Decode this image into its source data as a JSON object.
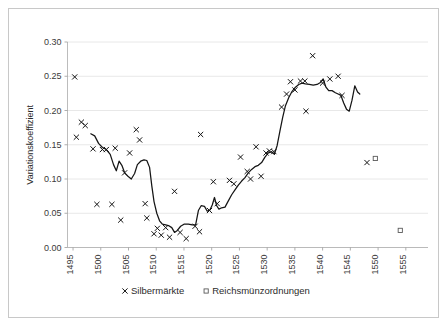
{
  "chart_data": {
    "type": "scatter",
    "title": "",
    "subtitle": "",
    "xlabel": "",
    "ylabel": "Variationskoeffizient",
    "xlim": [
      1494,
      1559
    ],
    "ylim": [
      0.0,
      0.3
    ],
    "grid": true,
    "legend_position": "bottom",
    "y_ticks": [
      "0.00",
      "0.05",
      "0.10",
      "0.15",
      "0.20",
      "0.25",
      "0.30"
    ],
    "y_tick_values": [
      0.0,
      0.05,
      0.1,
      0.15,
      0.2,
      0.25,
      0.3
    ],
    "x_ticks": [
      "1495",
      "1500",
      "1505",
      "1510",
      "1515",
      "1520",
      "1525",
      "1530",
      "1535",
      "1540",
      "1545",
      "1550",
      "1555"
    ],
    "x_tick_values": [
      1495,
      1500,
      1505,
      1510,
      1515,
      1520,
      1525,
      1530,
      1535,
      1540,
      1545,
      1550,
      1555
    ],
    "legend": [
      {
        "label": "Silbermärkte",
        "marker": "x",
        "color": "#141414"
      },
      {
        "label": "Reichsmünzordnungen",
        "marker": "square",
        "color": "#5a5a5a"
      }
    ],
    "series": [
      {
        "name": "Silbermärkte",
        "marker": "x",
        "type": "scatter",
        "points": [
          [
            1495.3,
            0.249
          ],
          [
            1495.6,
            0.161
          ],
          [
            1496.5,
            0.183
          ],
          [
            1497.2,
            0.178
          ],
          [
            1498.6,
            0.144
          ],
          [
            1499.3,
            0.063
          ],
          [
            1500.3,
            0.143
          ],
          [
            1501.0,
            0.143
          ],
          [
            1502.0,
            0.063
          ],
          [
            1502.6,
            0.145
          ],
          [
            1503.6,
            0.04
          ],
          [
            1504.3,
            0.109
          ],
          [
            1505.2,
            0.138
          ],
          [
            1506.4,
            0.172
          ],
          [
            1507.0,
            0.157
          ],
          [
            1508.0,
            0.064
          ],
          [
            1508.3,
            0.043
          ],
          [
            1509.6,
            0.02
          ],
          [
            1510.2,
            0.028
          ],
          [
            1510.9,
            0.018
          ],
          [
            1511.7,
            0.029
          ],
          [
            1512.4,
            0.015
          ],
          [
            1513.3,
            0.082
          ],
          [
            1514.3,
            0.022
          ],
          [
            1515.4,
            0.013
          ],
          [
            1517.0,
            0.031
          ],
          [
            1517.8,
            0.023
          ],
          [
            1518.0,
            0.165
          ],
          [
            1519.6,
            0.054
          ],
          [
            1520.3,
            0.096
          ],
          [
            1521.0,
            0.064
          ],
          [
            1523.2,
            0.098
          ],
          [
            1524.0,
            0.093
          ],
          [
            1525.2,
            0.132
          ],
          [
            1526.4,
            0.111
          ],
          [
            1527.0,
            0.1
          ],
          [
            1528.0,
            0.147
          ],
          [
            1528.9,
            0.104
          ],
          [
            1529.8,
            0.138
          ],
          [
            1530.4,
            0.141
          ],
          [
            1531.2,
            0.14
          ],
          [
            1532.6,
            0.205
          ],
          [
            1533.5,
            0.224
          ],
          [
            1534.2,
            0.242
          ],
          [
            1535.0,
            0.23
          ],
          [
            1536.0,
            0.243
          ],
          [
            1536.8,
            0.243
          ],
          [
            1537.0,
            0.199
          ],
          [
            1538.2,
            0.28
          ],
          [
            1540.0,
            0.24
          ],
          [
            1541.3,
            0.246
          ],
          [
            1542.8,
            0.25
          ],
          [
            1543.5,
            0.222
          ],
          [
            1548.0,
            0.124
          ]
        ]
      },
      {
        "name": "Reichsmünzordnungen",
        "marker": "square",
        "type": "scatter",
        "points": [
          [
            1549.5,
            0.13
          ],
          [
            1554.0,
            0.025
          ]
        ]
      },
      {
        "name": "Gleitender Durchschnitt",
        "marker": "none",
        "type": "line",
        "points": [
          [
            1498.2,
            0.166
          ],
          [
            1498.9,
            0.163
          ],
          [
            1499.6,
            0.152
          ],
          [
            1500.3,
            0.146
          ],
          [
            1501.0,
            0.143
          ],
          [
            1501.7,
            0.136
          ],
          [
            1502.3,
            0.121
          ],
          [
            1502.8,
            0.112
          ],
          [
            1503.3,
            0.126
          ],
          [
            1503.8,
            0.12
          ],
          [
            1504.3,
            0.109
          ],
          [
            1504.9,
            0.104
          ],
          [
            1505.5,
            0.1
          ],
          [
            1506.1,
            0.108
          ],
          [
            1506.6,
            0.121
          ],
          [
            1507.2,
            0.126
          ],
          [
            1507.8,
            0.128
          ],
          [
            1508.3,
            0.127
          ],
          [
            1508.8,
            0.117
          ],
          [
            1509.2,
            0.09
          ],
          [
            1509.6,
            0.067
          ],
          [
            1510.1,
            0.05
          ],
          [
            1510.6,
            0.039
          ],
          [
            1511.1,
            0.034
          ],
          [
            1511.7,
            0.033
          ],
          [
            1512.2,
            0.032
          ],
          [
            1512.8,
            0.029
          ],
          [
            1513.3,
            0.022
          ],
          [
            1513.8,
            0.025
          ],
          [
            1514.4,
            0.031
          ],
          [
            1515.0,
            0.034
          ],
          [
            1515.8,
            0.034
          ],
          [
            1516.5,
            0.033
          ],
          [
            1517.1,
            0.033
          ],
          [
            1517.6,
            0.054
          ],
          [
            1518.1,
            0.061
          ],
          [
            1518.7,
            0.06
          ],
          [
            1519.2,
            0.053
          ],
          [
            1519.7,
            0.055
          ],
          [
            1520.1,
            0.062
          ],
          [
            1520.5,
            0.073
          ],
          [
            1520.9,
            0.061
          ],
          [
            1521.3,
            0.056
          ],
          [
            1521.8,
            0.058
          ],
          [
            1522.4,
            0.059
          ],
          [
            1523.0,
            0.068
          ],
          [
            1523.6,
            0.077
          ],
          [
            1524.2,
            0.084
          ],
          [
            1524.8,
            0.091
          ],
          [
            1525.4,
            0.097
          ],
          [
            1526.0,
            0.102
          ],
          [
            1526.6,
            0.109
          ],
          [
            1527.2,
            0.114
          ],
          [
            1527.8,
            0.118
          ],
          [
            1528.4,
            0.12
          ],
          [
            1529.0,
            0.124
          ],
          [
            1529.6,
            0.132
          ],
          [
            1530.2,
            0.138
          ],
          [
            1530.8,
            0.14
          ],
          [
            1531.3,
            0.136
          ],
          [
            1531.8,
            0.149
          ],
          [
            1532.3,
            0.17
          ],
          [
            1532.8,
            0.19
          ],
          [
            1533.3,
            0.207
          ],
          [
            1533.9,
            0.219
          ],
          [
            1534.5,
            0.228
          ],
          [
            1535.1,
            0.234
          ],
          [
            1535.7,
            0.238
          ],
          [
            1536.3,
            0.24
          ],
          [
            1536.9,
            0.239
          ],
          [
            1537.6,
            0.238
          ],
          [
            1538.3,
            0.237
          ],
          [
            1539.0,
            0.238
          ],
          [
            1539.6,
            0.241
          ],
          [
            1540.1,
            0.246
          ],
          [
            1540.6,
            0.234
          ],
          [
            1541.1,
            0.229
          ],
          [
            1541.7,
            0.229
          ],
          [
            1542.3,
            0.226
          ],
          [
            1542.8,
            0.224
          ],
          [
            1543.3,
            0.222
          ],
          [
            1543.8,
            0.211
          ],
          [
            1544.3,
            0.202
          ],
          [
            1544.8,
            0.199
          ],
          [
            1545.3,
            0.215
          ],
          [
            1545.8,
            0.236
          ],
          [
            1546.3,
            0.227
          ],
          [
            1546.7,
            0.224
          ]
        ]
      }
    ]
  },
  "figure": {
    "background_color": "#ffffff",
    "border_color": "#c8c8c8",
    "grid_color": "#e2e2e2",
    "axis_color": "#b4b4b4"
  }
}
